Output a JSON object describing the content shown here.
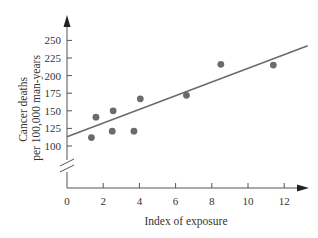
{
  "chart_data": {
    "type": "scatter",
    "title": "",
    "xlabel": "Index of exposure",
    "ylabel_lines": [
      "Cancer deaths",
      "per 100,000 man-years"
    ],
    "ylabel": "Cancer deaths per 100,000 man-years",
    "x_ticks": [
      0,
      2,
      4,
      6,
      8,
      10,
      12
    ],
    "y_ticks": [
      100,
      125,
      150,
      175,
      200,
      225,
      250
    ],
    "xlim": [
      0,
      13.3
    ],
    "ylim": [
      100,
      250
    ],
    "y_axis_break": true,
    "grid": false,
    "legend": null,
    "points": [
      {
        "x": 1.35,
        "y": 112
      },
      {
        "x": 1.6,
        "y": 141
      },
      {
        "x": 2.5,
        "y": 121
      },
      {
        "x": 2.55,
        "y": 150
      },
      {
        "x": 3.7,
        "y": 121
      },
      {
        "x": 4.05,
        "y": 167
      },
      {
        "x": 6.6,
        "y": 172
      },
      {
        "x": 8.5,
        "y": 216
      },
      {
        "x": 11.4,
        "y": 215
      }
    ],
    "regression_line": {
      "x0": 0,
      "y0": 113,
      "x1": 13.3,
      "y1": 242.5
    },
    "colors": {
      "points": "#6b6b6b",
      "line": "#6b6b6b",
      "axis": "#555555",
      "text": "#333333"
    }
  }
}
